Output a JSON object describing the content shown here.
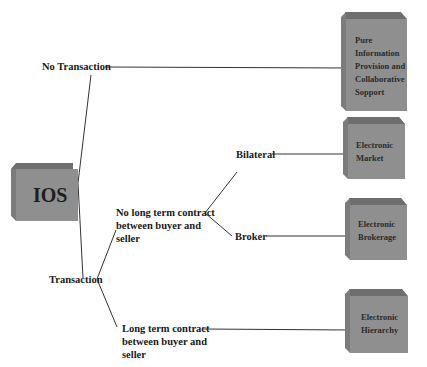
{
  "diagram": {
    "root": {
      "label": "IOS"
    },
    "branches": [
      {
        "label": "No Transaction"
      },
      {
        "label": "Transaction"
      }
    ],
    "sub_branches": [
      {
        "label_lines": [
          "No long term contract",
          "between buyer and",
          "seller"
        ]
      },
      {
        "label_lines": [
          "Long term contract",
          "between buyer and",
          "seller"
        ]
      }
    ],
    "leaf_branches": [
      {
        "label": "Bilateral"
      },
      {
        "label": "Broker"
      }
    ],
    "outcomes": [
      {
        "lines": [
          "Pure",
          "Information",
          "Provision and",
          "Collaborative",
          "Sopport"
        ]
      },
      {
        "lines": [
          "Electronic",
          "Market"
        ]
      },
      {
        "lines": [
          "Electronic",
          "Brokerage"
        ]
      },
      {
        "lines": [
          "Electronic",
          "Hierarchy"
        ]
      }
    ],
    "colors": {
      "box_front": "#8f8f8f",
      "box_top": "#6e6e6e",
      "line": "#333333"
    }
  }
}
